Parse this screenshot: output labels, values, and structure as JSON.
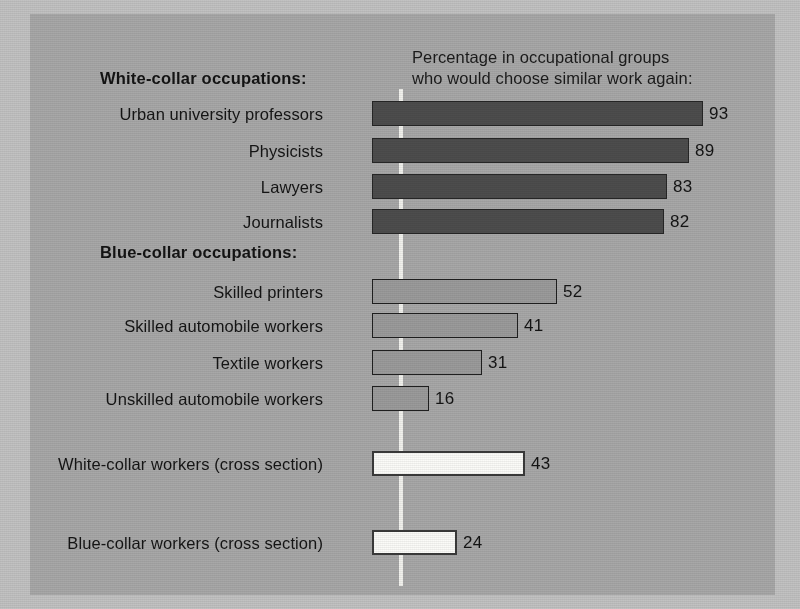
{
  "chart_data": {
    "type": "bar",
    "orientation": "horizontal",
    "title": "Percentage in occupational groups\nwho would choose similar work again:",
    "xlabel": "",
    "ylabel": "",
    "xlim": [
      0,
      100
    ],
    "grid": false,
    "legend": null,
    "value_suffix": "",
    "sections": [
      {
        "heading": "White-collar occupations:",
        "style": "dark",
        "categories": [
          "Urban university professors",
          "Physicists",
          "Lawyers",
          "Journalists"
        ],
        "values": [
          93,
          89,
          83,
          82
        ]
      },
      {
        "heading": "Blue-collar occupations:",
        "style": "mid",
        "categories": [
          "Skilled printers",
          "Skilled automobile workers",
          "Textile workers",
          "Unskilled automobile workers"
        ],
        "values": [
          52,
          41,
          31,
          16
        ]
      },
      {
        "heading": "",
        "style": "light",
        "categories": [
          "White-collar workers (cross section)",
          "Blue-collar workers (cross section)"
        ],
        "values": [
          43,
          24
        ]
      }
    ],
    "categories": [
      "Urban university professors",
      "Physicists",
      "Lawyers",
      "Journalists",
      "Skilled printers",
      "Skilled automobile workers",
      "Textile workers",
      "Unskilled automobile workers",
      "White-collar workers (cross section)",
      "Blue-collar workers (cross section)"
    ],
    "values": [
      93,
      89,
      83,
      82,
      52,
      41,
      31,
      16,
      43,
      24
    ],
    "colors": {
      "background": "#a8a8a8",
      "outer": "#c2c2c2",
      "dark_bar": "#4d4d4d",
      "mid_bar": "#9b9b9b",
      "light_bar": "#fbfbf8",
      "bar_outline": "#262626",
      "axis_line": "#f2f2ee",
      "text": "#141414"
    }
  },
  "layout": {
    "bar_origin_x": 342,
    "px_per_unit": 3.56,
    "rows": [
      {
        "idx": 0,
        "top": 101
      },
      {
        "idx": 1,
        "top": 138
      },
      {
        "idx": 2,
        "top": 174
      },
      {
        "idx": 3,
        "top": 209
      },
      {
        "idx": 4,
        "top": 279
      },
      {
        "idx": 5,
        "top": 313
      },
      {
        "idx": 6,
        "top": 350
      },
      {
        "idx": 7,
        "top": 386
      },
      {
        "idx": 8,
        "top": 451
      },
      {
        "idx": 9,
        "top": 530
      }
    ],
    "headings": [
      {
        "text_path": "chart_data.sections.0.heading",
        "top": 69
      },
      {
        "text_path": "chart_data.sections.1.heading",
        "top": 243
      }
    ]
  }
}
